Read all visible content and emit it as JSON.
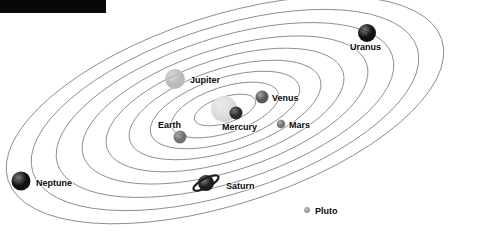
{
  "figure": {
    "kind": "solar-system-orrery-diagram",
    "background_color": "#ffffff",
    "orbit_stroke_color": "#8d8d8d",
    "label_color": "#0a0a0a",
    "center": {
      "x": 225,
      "y": 110
    },
    "orbit_rotation_deg": -18
  },
  "redaction_bar": {
    "color": "#070707",
    "x": 0,
    "y": 0,
    "width": 106,
    "height": 13
  },
  "sun": {
    "label": "",
    "x": 224,
    "y": 109,
    "radius": 13,
    "color": "#d2d2d2"
  },
  "orbits": [
    {
      "name": "mercury-orbit",
      "rx": 32,
      "ry": 13
    },
    {
      "name": "venus-orbit",
      "rx": 56,
      "ry": 23
    },
    {
      "name": "earth-orbit",
      "rx": 78,
      "ry": 32
    },
    {
      "name": "mars-orbit",
      "rx": 100,
      "ry": 41
    },
    {
      "name": "jupiter-orbit",
      "rx": 124,
      "ry": 51
    },
    {
      "name": "saturn-orbit",
      "rx": 149,
      "ry": 61
    },
    {
      "name": "uranus-orbit",
      "rx": 176,
      "ry": 72
    },
    {
      "name": "neptune-orbit",
      "rx": 202,
      "ry": 83
    },
    {
      "name": "pluto-orbit",
      "rx": 228,
      "ry": 94
    }
  ],
  "planets": [
    {
      "name": "mercury",
      "label": "Mercury",
      "x": 236,
      "y": 113,
      "radius": 6.5,
      "color": "#2a2a2a",
      "label_x": 222,
      "label_y": 130,
      "label_anchor": "start"
    },
    {
      "name": "venus",
      "label": "Venus",
      "x": 262,
      "y": 97,
      "radius": 6.5,
      "color": "#585858",
      "label_x": 272,
      "label_y": 101,
      "label_anchor": "start"
    },
    {
      "name": "earth",
      "label": "Earth",
      "x": 180,
      "y": 137,
      "radius": 6.5,
      "color": "#707070",
      "label_x": 158,
      "label_y": 128,
      "label_anchor": "start"
    },
    {
      "name": "mars",
      "label": "Mars",
      "x": 281,
      "y": 124,
      "radius": 4.2,
      "color": "#737373",
      "label_x": 289,
      "label_y": 128,
      "label_anchor": "start"
    },
    {
      "name": "jupiter",
      "label": "Jupiter",
      "x": 175,
      "y": 79,
      "radius": 10,
      "color": "#bcbcbc",
      "label_x": 190,
      "label_y": 83,
      "label_anchor": "start"
    },
    {
      "name": "saturn",
      "label": "Saturn",
      "x": 206,
      "y": 183,
      "radius": 8,
      "color": "#1d1d1d",
      "has_ring": true,
      "ring_rx": 14,
      "ring_ry": 4.6,
      "ring_tilt_deg": -28,
      "label_x": 226,
      "label_y": 189,
      "label_anchor": "start"
    },
    {
      "name": "uranus",
      "label": "Uranus",
      "x": 367,
      "y": 33,
      "radius": 9,
      "color": "#111111",
      "label_x": 350,
      "label_y": 50,
      "label_anchor": "start"
    },
    {
      "name": "neptune",
      "label": "Neptune",
      "x": 21,
      "y": 181,
      "radius": 9.5,
      "color": "#111111",
      "label_x": 36,
      "label_y": 186,
      "label_anchor": "start"
    },
    {
      "name": "pluto",
      "label": "Pluto",
      "x": 307,
      "y": 210,
      "radius": 3,
      "color": "#9c9c9c",
      "label_x": 315,
      "label_y": 214,
      "label_anchor": "start"
    }
  ]
}
